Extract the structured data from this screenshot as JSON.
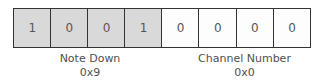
{
  "bits": [
    {
      "value": "1",
      "group": "status"
    },
    {
      "value": "0",
      "group": "status"
    },
    {
      "value": "0",
      "group": "status"
    },
    {
      "value": "1",
      "group": "status"
    },
    {
      "value": "0",
      "group": "channel"
    },
    {
      "value": "0",
      "group": "channel"
    },
    {
      "value": "0",
      "group": "channel"
    },
    {
      "value": "0",
      "group": "channel"
    }
  ],
  "groups": {
    "status": {
      "name": "Note Down",
      "hex": "0x9",
      "fill": "#d9d9d9"
    },
    "channel": {
      "name": "Channel Number",
      "hex": "0x0",
      "fill": "#fdfdfd"
    }
  }
}
